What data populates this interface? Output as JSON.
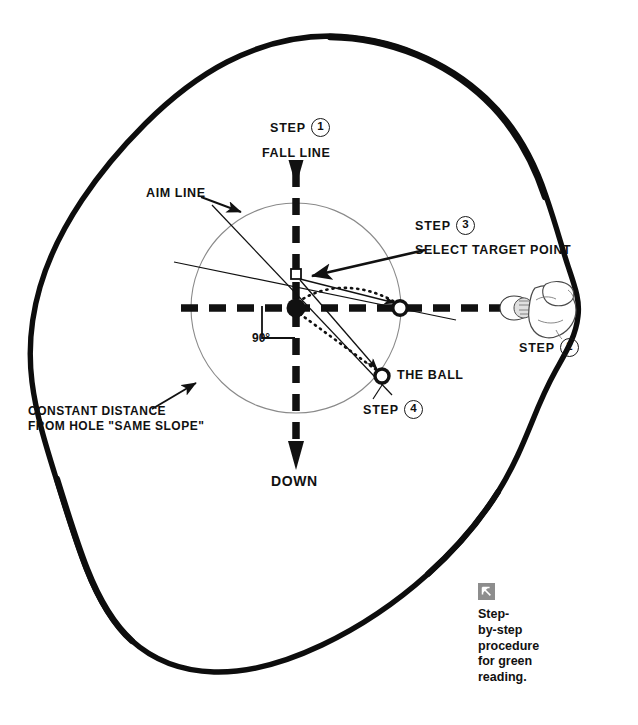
{
  "diagram": {
    "colors": {
      "ink": "#111111",
      "green_outline": "#0d0d0d",
      "circle_guide": "#8a8a8a",
      "caption_icon_bg": "#8d8d8d"
    },
    "labels": {
      "step1_word": "STEP",
      "step1_num": "1",
      "fall_line": "FALL LINE",
      "aim_line": "AIM LINE",
      "step3_word": "STEP",
      "step3_num": "3",
      "select_target_point": "SELECT TARGET POINT",
      "step2_word": "STEP",
      "step2_num": "2",
      "the_ball": "THE BALL",
      "step4_word": "STEP",
      "step4_num": "4",
      "angle": "90°",
      "constant_distance_line1": "CONSTANT DISTANCE",
      "constant_distance_line2": "FROM HOLE \"SAME SLOPE\"",
      "down": "DOWN"
    },
    "caption": {
      "icon": "arrow-up-left-icon",
      "text": "Step-\nby-step\nprocedure\nfor green\nreading."
    },
    "geometry": {
      "hole": {
        "x": 296,
        "y": 308
      },
      "target_point": {
        "x": 296,
        "y": 274
      },
      "aim_point_on_circle": {
        "x": 400,
        "y": 308
      },
      "ball": {
        "x": 382,
        "y": 376
      },
      "circle_radius": 105,
      "fall_line_top_y": 152,
      "fall_line_bottom_y": 460
    }
  }
}
